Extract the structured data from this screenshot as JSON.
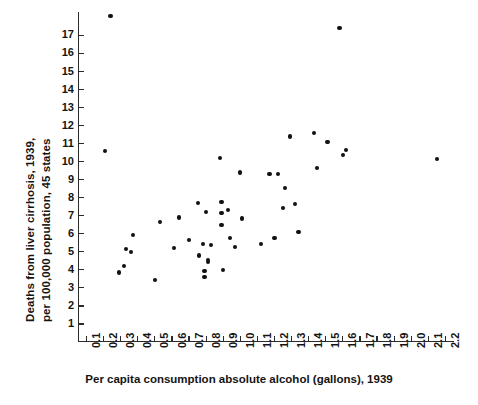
{
  "chart_data": {
    "type": "scatter",
    "title": "",
    "xlabel": "Per capita consumption absolute alcohol (gallons), 1939",
    "ylabel_line1": "Deaths from liver cirrhosis, 1939,",
    "ylabel_line2": "per 100,000 population, 45 states",
    "xlim": [
      0.05,
      2.25
    ],
    "ylim": [
      0,
      18.3
    ],
    "grid": false,
    "legend": null,
    "xticks": [
      "0.1",
      "0.2",
      "0.3",
      "0.4",
      "0.5",
      "0.6",
      "0.7",
      "0.8",
      "0.9",
      "1.0",
      "1.1",
      "1.2",
      "1.3",
      "1.4",
      "1.5",
      "1.6",
      "1.7",
      "1.8",
      "1.9",
      "2.0",
      "2.1",
      "2.2"
    ],
    "xtick_values": [
      0.1,
      0.2,
      0.3,
      0.4,
      0.5,
      0.6,
      0.7,
      0.8,
      0.9,
      1.0,
      1.1,
      1.2,
      1.3,
      1.4,
      1.5,
      1.6,
      1.7,
      1.8,
      1.9,
      2.0,
      2.1,
      2.2
    ],
    "yticks": [
      "1",
      "2",
      "3",
      "4",
      "5",
      "6",
      "7",
      "8",
      "9",
      "10",
      "11",
      "12",
      "13",
      "14",
      "15",
      "16",
      "17"
    ],
    "ytick_values": [
      1,
      2,
      3,
      4,
      5,
      6,
      7,
      8,
      9,
      10,
      11,
      12,
      13,
      14,
      15,
      16,
      17
    ],
    "point_color": "#111111",
    "axis_color": "#2b2b2b",
    "background": "#ffffff",
    "points": [
      {
        "x": 0.24,
        "y": 18.1
      },
      {
        "x": 0.21,
        "y": 10.6
      },
      {
        "x": 0.29,
        "y": 3.85
      },
      {
        "x": 0.33,
        "y": 5.15
      },
      {
        "x": 0.32,
        "y": 4.2
      },
      {
        "x": 0.36,
        "y": 5.0
      },
      {
        "x": 0.37,
        "y": 5.95
      },
      {
        "x": 0.5,
        "y": 3.45
      },
      {
        "x": 0.53,
        "y": 6.65
      },
      {
        "x": 0.61,
        "y": 5.2
      },
      {
        "x": 0.64,
        "y": 6.9
      },
      {
        "x": 0.7,
        "y": 5.65
      },
      {
        "x": 0.75,
        "y": 7.7
      },
      {
        "x": 0.76,
        "y": 4.8
      },
      {
        "x": 0.78,
        "y": 5.45
      },
      {
        "x": 0.79,
        "y": 3.95
      },
      {
        "x": 0.79,
        "y": 3.6
      },
      {
        "x": 0.8,
        "y": 7.2
      },
      {
        "x": 0.81,
        "y": 4.55
      },
      {
        "x": 0.81,
        "y": 4.45
      },
      {
        "x": 0.83,
        "y": 5.4
      },
      {
        "x": 0.88,
        "y": 10.2
      },
      {
        "x": 0.89,
        "y": 7.75
      },
      {
        "x": 0.89,
        "y": 7.15
      },
      {
        "x": 0.89,
        "y": 6.5
      },
      {
        "x": 0.9,
        "y": 4.0
      },
      {
        "x": 0.93,
        "y": 7.3
      },
      {
        "x": 0.94,
        "y": 5.75
      },
      {
        "x": 0.97,
        "y": 5.25
      },
      {
        "x": 1.0,
        "y": 9.4
      },
      {
        "x": 1.01,
        "y": 6.85
      },
      {
        "x": 1.12,
        "y": 5.45
      },
      {
        "x": 1.17,
        "y": 9.3
      },
      {
        "x": 1.2,
        "y": 5.75
      },
      {
        "x": 1.22,
        "y": 9.3
      },
      {
        "x": 1.25,
        "y": 7.45
      },
      {
        "x": 1.26,
        "y": 8.55
      },
      {
        "x": 1.29,
        "y": 11.4
      },
      {
        "x": 1.32,
        "y": 7.65
      },
      {
        "x": 1.34,
        "y": 6.1
      },
      {
        "x": 1.43,
        "y": 11.6
      },
      {
        "x": 1.45,
        "y": 9.65
      },
      {
        "x": 1.51,
        "y": 11.1
      },
      {
        "x": 1.58,
        "y": 17.4
      },
      {
        "x": 1.6,
        "y": 10.35
      },
      {
        "x": 1.62,
        "y": 10.65
      },
      {
        "x": 2.15,
        "y": 10.15
      }
    ]
  }
}
